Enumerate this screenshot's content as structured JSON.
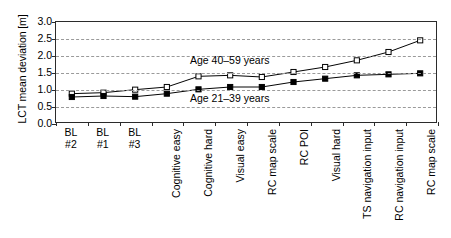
{
  "chart_data": {
    "type": "line",
    "title": "",
    "xlabel": "",
    "ylabel": "LCT mean deviation [m]",
    "ylim": [
      0.0,
      3.0
    ],
    "ytick_labels": [
      "3.0",
      "2.5",
      "2.0",
      "1.5",
      "1.0",
      "0.5",
      "0.0"
    ],
    "ytick_values": [
      3.0,
      2.5,
      2.0,
      1.5,
      1.0,
      0.5,
      0.0
    ],
    "grid": true,
    "grid_style": "dashed-horizontal",
    "legend_position": "inline-annotation",
    "categories": [
      "BL\n#2",
      "BL\n#1",
      "BL\n#3",
      "Cognitive easy",
      "Cognitive hard",
      "Visual easy",
      "RC map scale",
      "RC POI",
      "Visual hard",
      "TS navigation input",
      "RC navigation input",
      "RC map scale"
    ],
    "category_orientation": [
      "horizontal",
      "horizontal",
      "horizontal",
      "vertical",
      "vertical",
      "vertical",
      "vertical",
      "vertical",
      "vertical",
      "vertical",
      "vertical",
      "vertical"
    ],
    "series": [
      {
        "name": "Age 40–59 years",
        "marker": "open-square",
        "color": "#000000",
        "values": [
          0.85,
          0.88,
          0.97,
          1.05,
          1.37,
          1.4,
          1.35,
          1.5,
          1.65,
          1.85,
          2.1,
          2.45
        ]
      },
      {
        "name": "Age 21–39 years",
        "marker": "filled-square",
        "color": "#000000",
        "values": [
          0.75,
          0.78,
          0.76,
          0.85,
          0.98,
          1.05,
          1.05,
          1.2,
          1.3,
          1.4,
          1.43,
          1.46
        ]
      }
    ],
    "annotations": [
      {
        "text": "Age 40–59 years",
        "series": 0
      },
      {
        "text": "Age 21–39 years",
        "series": 1
      }
    ]
  },
  "colors": {
    "axis": "#2b2b2b",
    "grid": "#9a9a9a",
    "text": "#000000",
    "background": "#ffffff"
  }
}
